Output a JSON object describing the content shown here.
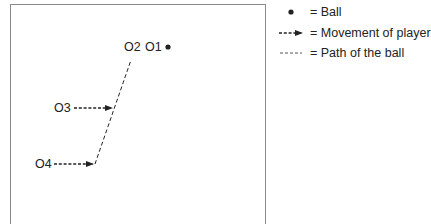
{
  "diagram": {
    "players": [
      {
        "id": "O1",
        "label": "O1"
      },
      {
        "id": "O2",
        "label": "O2"
      },
      {
        "id": "O3",
        "label": "O3"
      },
      {
        "id": "O4",
        "label": "O4"
      }
    ],
    "ball": {
      "symbol": "ball-dot"
    },
    "movements": [
      {
        "from": "O3",
        "description": "O3 moves right toward ball path"
      },
      {
        "from": "O4",
        "description": "O4 moves right toward ball path"
      }
    ],
    "ball_path": {
      "description": "dashed line from O4 end point up to O2"
    }
  },
  "legend": {
    "items": [
      {
        "symbol": "ball-dot",
        "label": "= Ball"
      },
      {
        "symbol": "dashed-arrow",
        "label": "= Movement of player"
      },
      {
        "symbol": "dashed-line",
        "label": "= Path of the ball"
      }
    ]
  },
  "colors": {
    "line": "#222222",
    "border": "#8a8a8a"
  }
}
